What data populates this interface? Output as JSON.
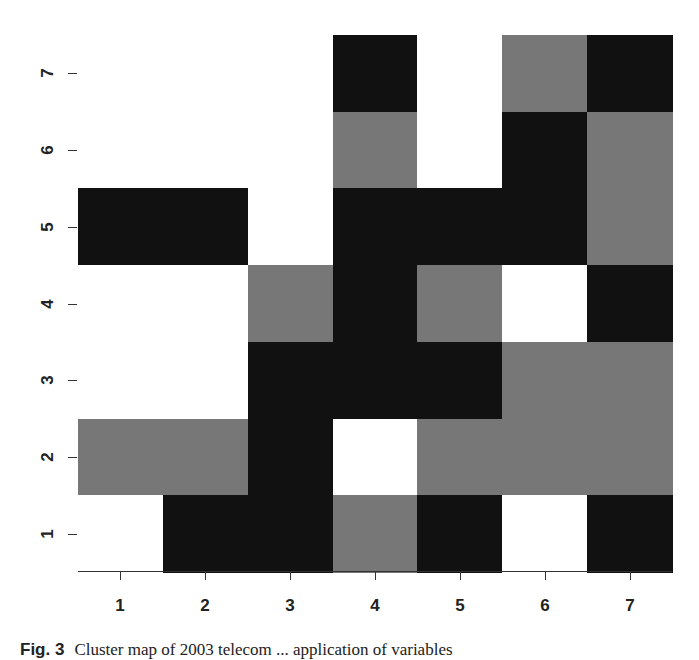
{
  "chart_data": {
    "type": "heatmap",
    "title": "",
    "xlabel": "",
    "ylabel": "",
    "x_ticks": [
      "1",
      "2",
      "3",
      "4",
      "5",
      "6",
      "7"
    ],
    "y_ticks": [
      "1",
      "2",
      "3",
      "4",
      "5",
      "6",
      "7"
    ],
    "xlim": [
      0.5,
      7.5
    ],
    "ylim": [
      0.5,
      7.5
    ],
    "grid": false,
    "legend": null,
    "value_encoding": {
      "0": "white",
      "1": "gray",
      "2": "black"
    },
    "colors": {
      "0": "#ffffff",
      "1": "#777777",
      "2": "#111111"
    },
    "rows_y_top_to_bottom": [
      7,
      6,
      5,
      4,
      3,
      2,
      1
    ],
    "matrix": [
      [
        0,
        0,
        0,
        2,
        0,
        1,
        2
      ],
      [
        0,
        0,
        0,
        1,
        0,
        2,
        1
      ],
      [
        2,
        2,
        0,
        2,
        2,
        2,
        1
      ],
      [
        0,
        0,
        1,
        2,
        1,
        0,
        2
      ],
      [
        0,
        0,
        2,
        2,
        2,
        1,
        1
      ],
      [
        1,
        1,
        2,
        0,
        1,
        1,
        1
      ],
      [
        0,
        2,
        2,
        1,
        2,
        0,
        2
      ]
    ]
  },
  "caption": {
    "fig_label": "Fig. 3",
    "text": "Cluster map of 2003 telecom ... application of variables"
  }
}
